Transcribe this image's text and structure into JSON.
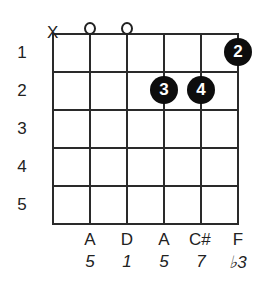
{
  "diagram": {
    "type": "guitar-chord-diagram",
    "strings": 6,
    "frets_shown": 5,
    "fret_numbers": [
      "1",
      "2",
      "3",
      "4",
      "5"
    ],
    "string_markers": [
      {
        "string": 1,
        "marker": "X"
      },
      {
        "string": 2,
        "marker": "o"
      },
      {
        "string": 3,
        "marker": "o"
      }
    ],
    "fingers": [
      {
        "string": 6,
        "fret": 1,
        "finger": "2"
      },
      {
        "string": 4,
        "fret": 2,
        "finger": "3"
      },
      {
        "string": 5,
        "fret": 2,
        "finger": "4"
      }
    ],
    "notes": [
      "",
      "A",
      "D",
      "A",
      "C#",
      "F"
    ],
    "intervals": [
      "",
      "5",
      "1",
      "5",
      "7",
      "♭3"
    ]
  },
  "colors": {
    "line": "#2a2a2a",
    "dot": "#0d0d0d",
    "dot_text": "#ffffff",
    "background": "#ffffff"
  }
}
